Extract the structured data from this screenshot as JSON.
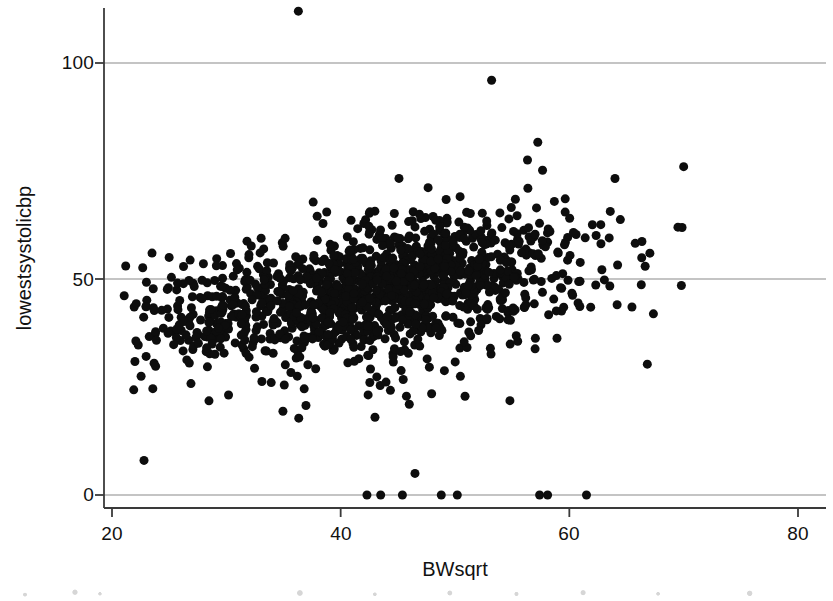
{
  "figure": {
    "width": 833,
    "height": 601,
    "background_color": "#ffffff"
  },
  "chart_data": {
    "type": "scatter",
    "title": "",
    "xlabel": "BWsqrt",
    "ylabel": "lowestsystolicbp",
    "xlim": [
      20,
      80
    ],
    "ylim": [
      -6,
      118
    ],
    "xticks": [
      20,
      40,
      60,
      80
    ],
    "yticks": [
      0,
      50,
      100
    ],
    "xtick_labels": [
      "20",
      "40",
      "60",
      "80"
    ],
    "ytick_labels": [
      "0",
      "50",
      "100"
    ],
    "grid": "horizontal-only",
    "gridlines_y": [
      0,
      50,
      100
    ],
    "grid_color": "#8a8a8a",
    "axis_color": "#3a3a3a",
    "legend": null,
    "marker": {
      "shape": "circle",
      "color": "#0d0d0d",
      "size_px": 9,
      "opacity": 1
    },
    "n_points_approx": 1400,
    "cloud": {
      "x_range": [
        20.8,
        70.2
      ],
      "y_core_at_x25": [
        28,
        48
      ],
      "y_core_at_x35": [
        33,
        56
      ],
      "y_core_at_x45": [
        36,
        60
      ],
      "y_core_at_x55": [
        38,
        66
      ],
      "y_core_at_x65": [
        40,
        70
      ],
      "trend_slope": 0.42,
      "trend_intercept": 29.5
    },
    "outliers": [
      {
        "x": 36.3,
        "y": 112
      },
      {
        "x": 53.2,
        "y": 96
      },
      {
        "x": 22.8,
        "y": 8
      },
      {
        "x": 46.5,
        "y": 5
      },
      {
        "x": 46.0,
        "y": 21
      },
      {
        "x": 43.0,
        "y": 18
      },
      {
        "x": 69.8,
        "y": 48.5
      },
      {
        "x": 70.0,
        "y": 76
      },
      {
        "x": 69.5,
        "y": 62
      },
      {
        "x": 21.2,
        "y": 53
      },
      {
        "x": 23.5,
        "y": 56
      },
      {
        "x": 25.0,
        "y": 55
      }
    ],
    "zero_points": [
      {
        "x": 42.3,
        "y": 0
      },
      {
        "x": 43.5,
        "y": 0
      },
      {
        "x": 45.4,
        "y": 0
      },
      {
        "x": 48.8,
        "y": 0
      },
      {
        "x": 50.2,
        "y": 0
      },
      {
        "x": 57.4,
        "y": 0
      },
      {
        "x": 58.1,
        "y": 0
      },
      {
        "x": 61.5,
        "y": 0
      }
    ]
  }
}
